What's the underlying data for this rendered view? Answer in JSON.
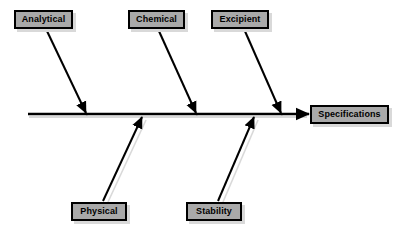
{
  "diagram": {
    "type": "fishbone-ishikawa",
    "title": "",
    "effect": {
      "id": "specifications",
      "label": "Specifications",
      "role": "effect-head"
    },
    "spine": {
      "label": "main-spine",
      "orientation": "horizontal",
      "x_start": 28,
      "x_end": 308,
      "y": 114,
      "arrow_at": "right"
    },
    "causes_top": [
      {
        "id": "analytical",
        "label": "Analytical",
        "branch_from_x": 46,
        "branch_from_y": 29,
        "branch_to_x": 86,
        "branch_to_y": 113
      },
      {
        "id": "chemical",
        "label": "Chemical",
        "branch_from_x": 158,
        "branch_from_y": 29,
        "branch_to_x": 196,
        "branch_to_y": 113
      },
      {
        "id": "excipient",
        "label": "Excipient",
        "branch_from_x": 244,
        "branch_from_y": 29,
        "branch_to_x": 281,
        "branch_to_y": 113
      }
    ],
    "causes_bottom": [
      {
        "id": "physical",
        "label": "Physical",
        "branch_from_x": 103,
        "branch_from_y": 201,
        "branch_to_x": 142,
        "branch_to_y": 118
      },
      {
        "id": "stability",
        "label": "Stability",
        "branch_from_x": 218,
        "branch_from_y": 201,
        "branch_to_x": 254,
        "branch_to_y": 118
      }
    ],
    "colors": {
      "background": "#ffffff",
      "box_fill": "#a9a9a9",
      "box_border": "#000000",
      "box_shadow": "#d9d9d9",
      "line": "#000000",
      "line_shadow": "#d9d9d9",
      "text": "#000000"
    }
  }
}
